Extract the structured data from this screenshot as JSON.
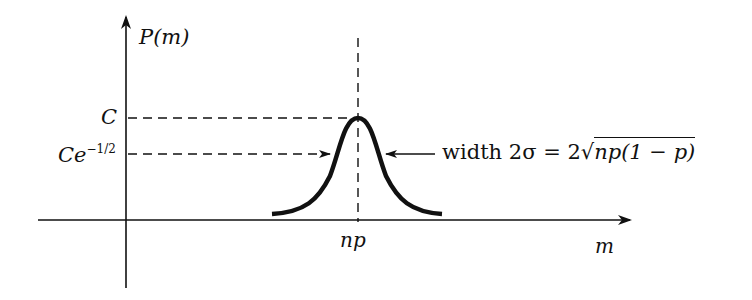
{
  "diagram": {
    "y_axis_label": "P(m)",
    "x_axis_label": "m",
    "peak_level_label": "C",
    "half_level_label_base": "Ce",
    "half_level_label_exp": "−1/2",
    "peak_x_label": "np",
    "width_label_prefix": "width 2σ = 2√",
    "width_label_sqrt_arg": "np(1 − p)",
    "colors": {
      "ink": "#111111",
      "background": "#ffffff"
    }
  }
}
